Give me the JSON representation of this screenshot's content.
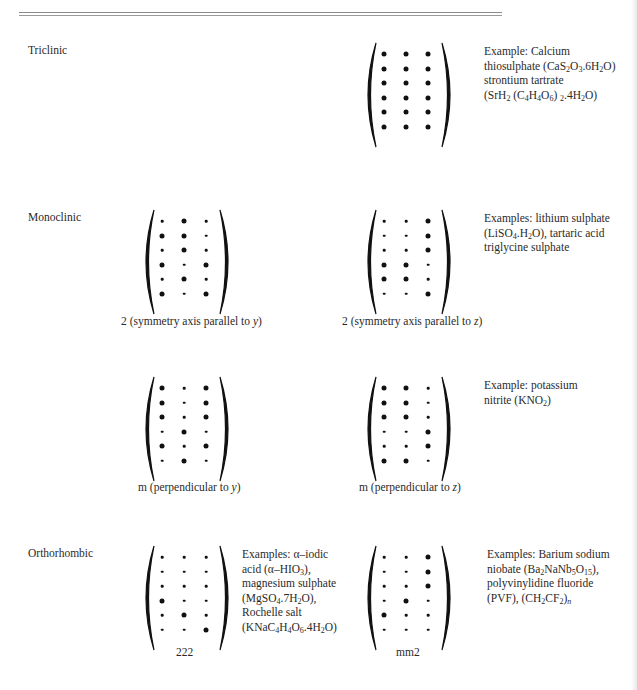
{
  "sections": {
    "triclinic": {
      "label": "Triclinic"
    },
    "monoclinic": {
      "label": "Monoclinic"
    },
    "orthorhombic": {
      "label": "Orthorhombic"
    }
  },
  "matrices": [
    {
      "id": "triclinic-1",
      "caption": "",
      "x": 362,
      "y": 40,
      "dots": [
        [
          2,
          2,
          2
        ],
        [
          2,
          2,
          2
        ],
        [
          2,
          2,
          2
        ],
        [
          2,
          2,
          2
        ],
        [
          2,
          2,
          2
        ],
        [
          2,
          2,
          2
        ]
      ]
    },
    {
      "id": "monoclinic-2y",
      "caption": "2 (symmetry axis parallel to ",
      "caption_var": "y",
      "x": 140,
      "y": 207,
      "dots": [
        [
          1,
          2,
          1
        ],
        [
          2,
          2,
          1
        ],
        [
          1,
          2,
          1
        ],
        [
          2,
          1,
          2
        ],
        [
          1,
          2,
          1
        ],
        [
          2,
          1,
          2
        ]
      ]
    },
    {
      "id": "monoclinic-2z",
      "caption": "2 (symmetry axis parallel to ",
      "caption_var": "z",
      "x": 362,
      "y": 207,
      "dots": [
        [
          1,
          1,
          2
        ],
        [
          1,
          1,
          2
        ],
        [
          1,
          1,
          2
        ],
        [
          2,
          2,
          1
        ],
        [
          2,
          2,
          1
        ],
        [
          1,
          1,
          2
        ]
      ]
    },
    {
      "id": "monoclinic-my",
      "caption": "m (perpendicular to ",
      "caption_var": "y",
      "x": 140,
      "y": 374,
      "dots": [
        [
          2,
          1,
          2
        ],
        [
          2,
          1,
          2
        ],
        [
          2,
          1,
          2
        ],
        [
          1,
          2,
          1
        ],
        [
          2,
          1,
          2
        ],
        [
          1,
          2,
          1
        ]
      ]
    },
    {
      "id": "monoclinic-mz",
      "caption": "m (perpendicular to ",
      "caption_var": "z",
      "x": 362,
      "y": 374,
      "dots": [
        [
          2,
          2,
          1
        ],
        [
          2,
          2,
          1
        ],
        [
          2,
          2,
          1
        ],
        [
          1,
          1,
          2
        ],
        [
          1,
          1,
          2
        ],
        [
          2,
          2,
          1
        ]
      ]
    },
    {
      "id": "orthorhombic-222",
      "caption": "222",
      "caption_var": "",
      "x": 140,
      "y": 543,
      "dots": [
        [
          1,
          1,
          1
        ],
        [
          1,
          1,
          1
        ],
        [
          1,
          1,
          1
        ],
        [
          2,
          1,
          1
        ],
        [
          1,
          2,
          1
        ],
        [
          1,
          1,
          2
        ]
      ]
    },
    {
      "id": "orthorhombic-mm2",
      "caption": "mm2",
      "caption_var": "",
      "x": 362,
      "y": 543,
      "dots": [
        [
          1,
          1,
          2
        ],
        [
          1,
          1,
          2
        ],
        [
          1,
          1,
          2
        ],
        [
          1,
          2,
          1
        ],
        [
          2,
          1,
          1
        ],
        [
          1,
          1,
          1
        ]
      ]
    }
  ],
  "examples": {
    "triclinic": {
      "line1": "Example: Calcium",
      "line2_pre": "thiosulphate (CaS",
      "line2_s1": "2",
      "line2_m1": "O",
      "line2_s2": "3",
      "line2_m2": ".6H",
      "line2_s3": "2",
      "line2_post": "O)",
      "line3": "strontium tartrate",
      "line4_pre": "(SrH",
      "line4_s1": "2",
      "line4_m1": " (C",
      "line4_s2": "4",
      "line4_m2": "H",
      "line4_s3": "4",
      "line4_m3": "O",
      "line4_s4": "6",
      "line4_m4": ") ",
      "line4_s5": "2",
      "line4_m5": ".4H",
      "line4_s6": "2",
      "line4_post": "O)"
    },
    "monoclinic": {
      "line1": "Examples: lithium sulphate",
      "line2_pre": "(LiSO",
      "line2_s1": "4",
      "line2_m1": ".H",
      "line2_s2": "2",
      "line2_post": "O), tartaric acid",
      "line3": "triglycine sulphate"
    },
    "monoclinic_m": {
      "line1": "Example: potassium",
      "line2_pre": "nitrite (KNO",
      "line2_s1": "2",
      "line2_post": ")"
    },
    "orthorhombic_222": {
      "line1": "Examples: α–iodic",
      "line2_pre": "acid (α–HIO",
      "line2_s1": "3",
      "line2_post": "),",
      "line3": "magnesium sulphate",
      "line4_pre": "(MgSO",
      "line4_s1": "4",
      "line4_m1": ".7H",
      "line4_s2": "2",
      "line4_post": "O),",
      "line5": "Rochelle salt",
      "line6_pre": "(KNaC",
      "line6_s1": "4",
      "line6_m1": "H",
      "line6_s2": "4",
      "line6_m2": "O",
      "line6_s3": "6",
      "line6_m3": ".4H",
      "line6_s4": "2",
      "line6_post": "O)"
    },
    "orthorhombic_mm2": {
      "line1": "Examples: Barium sodium",
      "line2_pre": "niobate (Ba",
      "line2_s1": "2",
      "line2_m1": "NaNb",
      "line2_s2": "5",
      "line2_m2": "O",
      "line2_s3": "15",
      "line2_post": "),",
      "line3": "polyvinylidine fluoride",
      "line4_pre": "(PVF), (CH",
      "line4_s1": "2",
      "line4_m1": "CF",
      "line4_s2": "2",
      "line4_m2": ")",
      "line4_s3": "n"
    }
  }
}
